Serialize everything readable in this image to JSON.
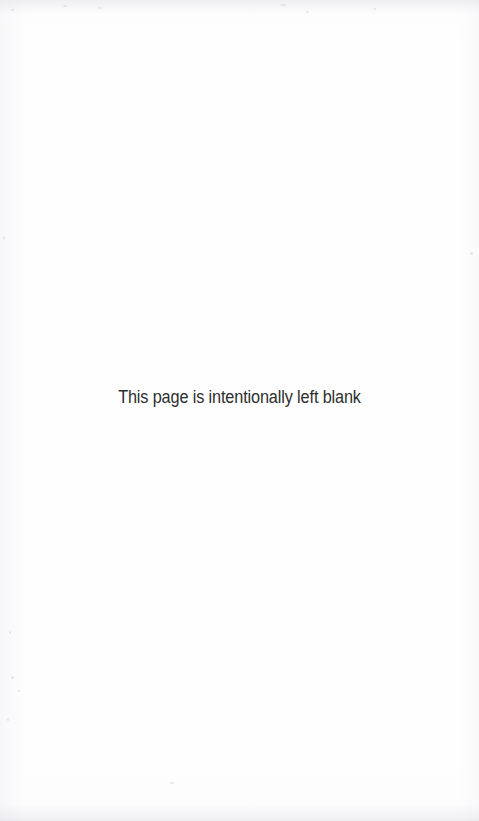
{
  "page": {
    "notice_text": "This page is intentionally left blank",
    "background_color": "#fefefe",
    "text_color": "#2e2e2e",
    "width_px": 479,
    "height_px": 821
  }
}
